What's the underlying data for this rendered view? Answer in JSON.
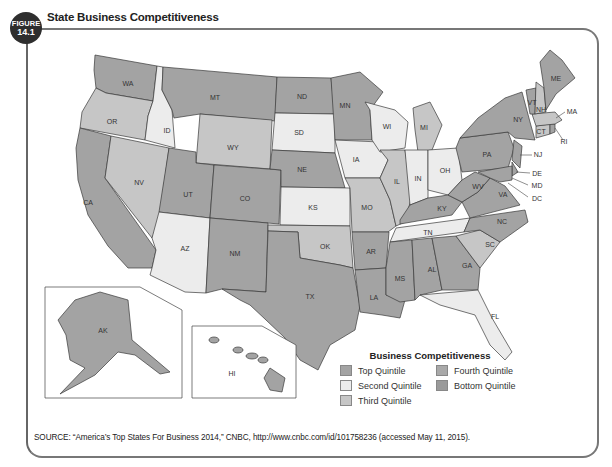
{
  "figure": {
    "label": "FIGURE",
    "number": "14.1",
    "title": "State Business Competitiveness"
  },
  "legend": {
    "title": "Business Competitiveness",
    "items": [
      {
        "label": "Top Quintile",
        "color": "#a3a3a3"
      },
      {
        "label": "Fourth Quintile",
        "color": "#a9a9a9"
      },
      {
        "label": "Second Quintile",
        "color": "#ececec"
      },
      {
        "label": "Bottom Quintile",
        "color": "#9a9a9a"
      },
      {
        "label": "Third Quintile",
        "color": "#c6c6c6"
      }
    ]
  },
  "source": "SOURCE: “America’s Top States For Business 2014,” CNBC, http://www.cnbc.com/id/101758236 (accessed May 11, 2015).",
  "states": {
    "WA": "WA",
    "OR": "OR",
    "CA": "CA",
    "ID": "ID",
    "NV": "NV",
    "MT": "MT",
    "WY": "WY",
    "UT": "UT",
    "AZ": "AZ",
    "CO": "CO",
    "NM": "NM",
    "ND": "ND",
    "SD": "SD",
    "NE": "NE",
    "KS": "KS",
    "OK": "OK",
    "TX": "TX",
    "MN": "MN",
    "IA": "IA",
    "MO": "MO",
    "AR": "AR",
    "LA": "LA",
    "WI": "WI",
    "IL": "IL",
    "MI": "MI",
    "IN": "IN",
    "OH": "OH",
    "KY": "KY",
    "TN": "TN",
    "MS": "MS",
    "AL": "AL",
    "GA": "GA",
    "FL": "FL",
    "SC": "SC",
    "NC": "NC",
    "VA": "VA",
    "WV": "WV",
    "PA": "PA",
    "NY": "NY",
    "ME": "ME",
    "VT": "VT",
    "NH": "NH",
    "MA": "MA",
    "RI": "RI",
    "CT": "CT",
    "NJ": "NJ",
    "DE": "DE",
    "MD": "MD",
    "DC": "DC",
    "AK": "AK",
    "HI": "HI"
  }
}
